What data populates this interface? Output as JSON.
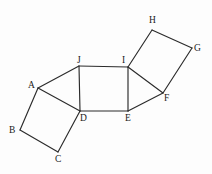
{
  "figure": {
    "background_color": "#fdfdfd",
    "stroke_color": "#2b2b2b",
    "label_color": "#1a1a1a",
    "canvas": {
      "width": 212,
      "height": 174
    }
  },
  "vertices": [
    {
      "id": "A",
      "label": "A",
      "x": 38,
      "y": 88,
      "label_x": 28,
      "label_y": 81
    },
    {
      "id": "B",
      "label": "B",
      "x": 20,
      "y": 130,
      "label_x": 9,
      "label_y": 126
    },
    {
      "id": "C",
      "label": "C",
      "x": 58,
      "y": 152,
      "label_x": 55,
      "label_y": 155
    },
    {
      "id": "D",
      "label": "D",
      "x": 80,
      "y": 111,
      "label_x": 80,
      "label_y": 114
    },
    {
      "id": "E",
      "label": "E",
      "x": 128,
      "y": 111,
      "label_x": 125,
      "label_y": 114
    },
    {
      "id": "F",
      "label": "F",
      "x": 163,
      "y": 93,
      "label_x": 164,
      "label_y": 94
    },
    {
      "id": "G",
      "label": "G",
      "x": 192,
      "y": 48,
      "label_x": 194,
      "label_y": 44
    },
    {
      "id": "H",
      "label": "H",
      "x": 152,
      "y": 30,
      "label_x": 149,
      "label_y": 16
    },
    {
      "id": "I",
      "label": "I",
      "x": 128,
      "y": 67,
      "label_x": 122,
      "label_y": 56
    },
    {
      "id": "J",
      "label": "J",
      "x": 79,
      "y": 66,
      "label_x": 77,
      "label_y": 56
    }
  ],
  "edges": [
    {
      "id": "edge-A-B",
      "from": "A",
      "to": "B",
      "name": "segment-AB"
    },
    {
      "id": "edge-B-C",
      "from": "B",
      "to": "C",
      "name": "segment-BC"
    },
    {
      "id": "edge-C-D",
      "from": "C",
      "to": "D",
      "name": "segment-CD"
    },
    {
      "id": "edge-D-A",
      "from": "D",
      "to": "A",
      "name": "segment-DA"
    },
    {
      "id": "edge-A-J",
      "from": "A",
      "to": "J",
      "name": "segment-AJ"
    },
    {
      "id": "edge-J-D",
      "from": "J",
      "to": "D",
      "name": "segment-JD"
    },
    {
      "id": "edge-J-I",
      "from": "J",
      "to": "I",
      "name": "segment-JI"
    },
    {
      "id": "edge-I-E",
      "from": "I",
      "to": "E",
      "name": "segment-IE"
    },
    {
      "id": "edge-E-D",
      "from": "E",
      "to": "D",
      "name": "segment-ED"
    },
    {
      "id": "edge-I-F",
      "from": "I",
      "to": "F",
      "name": "segment-IF"
    },
    {
      "id": "edge-F-E",
      "from": "F",
      "to": "E",
      "name": "segment-FE"
    },
    {
      "id": "edge-I-H",
      "from": "I",
      "to": "H",
      "name": "segment-IH"
    },
    {
      "id": "edge-H-G",
      "from": "H",
      "to": "G",
      "name": "segment-HG"
    },
    {
      "id": "edge-G-F",
      "from": "G",
      "to": "F",
      "name": "segment-GF"
    }
  ],
  "shapes": [
    {
      "name": "square-ABCD",
      "vertices": [
        "A",
        "B",
        "C",
        "D"
      ],
      "type": "square"
    },
    {
      "name": "triangle-AJD",
      "vertices": [
        "A",
        "J",
        "D"
      ],
      "type": "triangle"
    },
    {
      "name": "square-JIED",
      "vertices": [
        "J",
        "I",
        "E",
        "D"
      ],
      "type": "square"
    },
    {
      "name": "triangle-IFE",
      "vertices": [
        "I",
        "F",
        "E"
      ],
      "type": "triangle"
    },
    {
      "name": "square-IHGF",
      "vertices": [
        "I",
        "H",
        "G",
        "F"
      ],
      "type": "square"
    }
  ]
}
